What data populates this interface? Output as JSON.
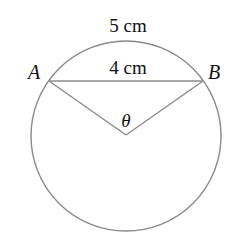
{
  "diagram": {
    "arc_label": "5 cm",
    "chord_label": "4 cm",
    "point_a": "A",
    "point_b": "B",
    "angle_label": "θ",
    "stroke_color": "#8a8a8a",
    "circle": {
      "cx": 126,
      "cy": 136,
      "r": 95
    },
    "points": {
      "A": [
        49,
        81
      ],
      "B": [
        203,
        81
      ],
      "O": [
        126,
        135
      ]
    }
  }
}
